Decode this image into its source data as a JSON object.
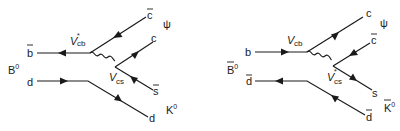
{
  "diagrams": [
    {
      "id": "B0-decay",
      "meson_in": {
        "base": "B",
        "sup": "0",
        "bar": false
      },
      "meson_out1": "ψ",
      "meson_out2": {
        "base": "K",
        "sup": "0",
        "bar": false
      },
      "quarks": {
        "in_top": {
          "label": "b",
          "bar": true
        },
        "in_bottom": {
          "label": "d",
          "bar": false
        },
        "out_1": {
          "label": "c",
          "bar": true
        },
        "out_2": {
          "label": "c",
          "bar": false
        },
        "out_3": {
          "label": "s",
          "bar": true
        },
        "out_4": {
          "label": "d",
          "bar": false
        }
      },
      "vertex_top": {
        "base": "V",
        "sub": "cb",
        "sup": "*"
      },
      "vertex_bottom": {
        "base": "V",
        "sub": "cs",
        "sup": ""
      }
    },
    {
      "id": "B0bar-decay",
      "meson_in": {
        "base": "B",
        "sup": "0",
        "bar": true
      },
      "meson_out1": "ψ",
      "meson_out2": {
        "base": "K",
        "sup": "0",
        "bar": true
      },
      "quarks": {
        "in_top": {
          "label": "b",
          "bar": false
        },
        "in_bottom": {
          "label": "d",
          "bar": true
        },
        "out_1": {
          "label": "c",
          "bar": false
        },
        "out_2": {
          "label": "c",
          "bar": true
        },
        "out_3": {
          "label": "s",
          "bar": false
        },
        "out_4": {
          "label": "d",
          "bar": true
        }
      },
      "vertex_top": {
        "base": "V",
        "sub": "cb",
        "sup": ""
      },
      "vertex_bottom": {
        "base": "V",
        "sub": "cs",
        "sup": "*"
      }
    }
  ],
  "colors": {
    "ink": "#1a1a1a",
    "background": "#ffffff"
  }
}
